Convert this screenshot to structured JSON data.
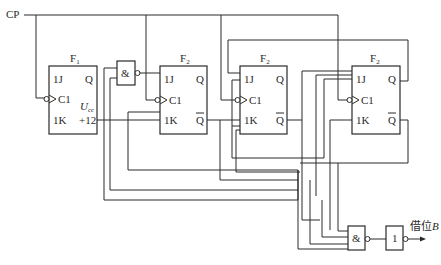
{
  "diagram": {
    "type": "synchronous counter with borrow output",
    "clock_label": "CP",
    "flipflops": [
      {
        "title": "F",
        "subscript": "1",
        "pins": {
          "j": "1J",
          "k": "1K",
          "clk": "C1",
          "q": "Q"
        },
        "extra": {
          "supply_label": "U",
          "supply_sub": "cc",
          "supply_value": "+12"
        }
      },
      {
        "title": "F",
        "subscript": "2",
        "pins": {
          "j": "1J",
          "k": "1K",
          "clk": "C1",
          "q": "Q",
          "qbar": "Q"
        }
      },
      {
        "title": "F",
        "subscript": "2",
        "pins": {
          "j": "1J",
          "k": "1K",
          "clk": "C1",
          "q": "Q",
          "qbar": "Q"
        }
      },
      {
        "title": "F",
        "subscript": "2",
        "pins": {
          "j": "1J",
          "k": "1K",
          "clk": "C1",
          "q": "Q",
          "qbar": "Q"
        }
      }
    ],
    "gates": [
      {
        "id": "nand-1",
        "symbol": "&"
      },
      {
        "id": "nand-out",
        "symbol": "&"
      },
      {
        "id": "not-out",
        "symbol": "1"
      }
    ],
    "output_label": "借位",
    "output_var": "B"
  }
}
